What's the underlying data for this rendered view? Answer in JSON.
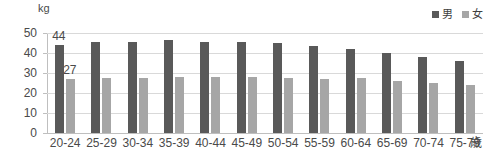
{
  "chart_data": {
    "type": "bar",
    "title": "",
    "xlabel": "歳",
    "ylabel": "kg",
    "ylim": [
      0,
      50
    ],
    "ytick_values": [
      0,
      10,
      20,
      30,
      40,
      50
    ],
    "ytick_labels": [
      "0",
      "10",
      "20",
      "30",
      "40",
      "50"
    ],
    "grid": true,
    "legend_position": "top-right",
    "categories": [
      "20-24",
      "25-29",
      "30-34",
      "35-39",
      "40-44",
      "45-49",
      "50-54",
      "55-59",
      "60-64",
      "65-69",
      "70-74",
      "75-79"
    ],
    "series": [
      {
        "name": "男",
        "color": "#595959",
        "values": [
          44,
          45.5,
          45.5,
          46.5,
          45.5,
          45.5,
          45,
          43.5,
          42,
          40,
          38,
          36
        ]
      },
      {
        "name": "女",
        "color": "#a6a6a6",
        "values": [
          27,
          27.5,
          27.5,
          28,
          28,
          28,
          27.5,
          27,
          27.5,
          26,
          25,
          24
        ]
      }
    ],
    "data_labels": [
      {
        "series": "男",
        "category": "20-24",
        "text": "44"
      },
      {
        "series": "女",
        "category": "20-24",
        "text": "27"
      }
    ]
  },
  "legend": {
    "entries": [
      {
        "label": "男",
        "color": "#595959"
      },
      {
        "label": "女",
        "color": "#a6a6a6"
      }
    ]
  },
  "axis": {
    "unit_y": "kg",
    "unit_x": "歳"
  },
  "colors": {
    "male_bar": "#595959",
    "female_bar": "#a6a6a6",
    "gridline": "#d9d9d9",
    "axis": "#bfbfbf",
    "text": "#4a4a4a",
    "background": "#ffffff"
  }
}
